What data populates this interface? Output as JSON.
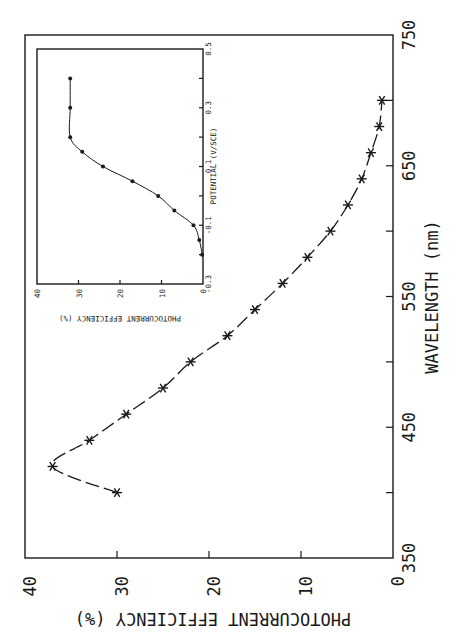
{
  "chart_data": [
    {
      "type": "line",
      "title": "",
      "orientation_note": "figure rotated 90deg counter-clockwise on page",
      "xlabel": "WAVELENGTH (nm)",
      "ylabel": "PHOTOCURRENT EFFICIENCY (%)",
      "xlim": [
        350,
        750
      ],
      "ylim": [
        0,
        40
      ],
      "xticks": [
        "350",
        "450",
        "550",
        "650",
        "750"
      ],
      "yticks": [
        "0",
        "10",
        "20",
        "30",
        "40"
      ],
      "grid": false,
      "marker": "asterisk",
      "line_style": "dashed",
      "x": [
        400,
        420,
        440,
        460,
        480,
        500,
        520,
        540,
        560,
        580,
        600,
        620,
        640,
        660,
        680,
        700
      ],
      "values": [
        30,
        37,
        33,
        29,
        25,
        22,
        18,
        15,
        12,
        9.3,
        6.8,
        4.9,
        3.4,
        2.4,
        1.5,
        1.2
      ]
    },
    {
      "type": "line",
      "title": "",
      "position": "inset",
      "xlabel": "POTENTIAL (V/SCE)",
      "ylabel": "PHOTOCURRENT EFFICIENCY (%)",
      "xlim": [
        -0.3,
        0.5
      ],
      "ylim": [
        0,
        40
      ],
      "xticks": [
        "-0.3",
        "-0.1",
        "0.1",
        "0.3",
        "0.5"
      ],
      "yticks": [
        "0",
        "10",
        "20",
        "30",
        "40"
      ],
      "grid": false,
      "marker": "filled-circle",
      "line_style": "solid",
      "x": [
        -0.2,
        -0.15,
        -0.1,
        -0.05,
        0.0,
        0.05,
        0.1,
        0.15,
        0.2,
        0.3,
        0.4
      ],
      "values": [
        0.2,
        0.9,
        2.3,
        6.9,
        10.8,
        17.0,
        24.1,
        29.1,
        32,
        32,
        32
      ]
    }
  ],
  "labels": {
    "main_x_title": "WAVELENGTH  (nm)",
    "main_y_title": "PHOTOCURRENT EFFICIENCY (%)",
    "inset_x_title": "POTENTIAL  (V/SCE)",
    "inset_y_title": "PHOTOCURRENT EFFICIENCY  (%)",
    "main_x_ticks": [
      "350",
      "450",
      "550",
      "650",
      "750"
    ],
    "main_y_ticks": [
      "40",
      "30",
      "20",
      "10",
      "0"
    ],
    "inset_x_ticks": [
      "-0.3",
      "-0.1",
      "0.1",
      "0.3",
      "0.5"
    ],
    "inset_y_ticks": [
      "40",
      "30",
      "20",
      "10",
      "0"
    ]
  }
}
